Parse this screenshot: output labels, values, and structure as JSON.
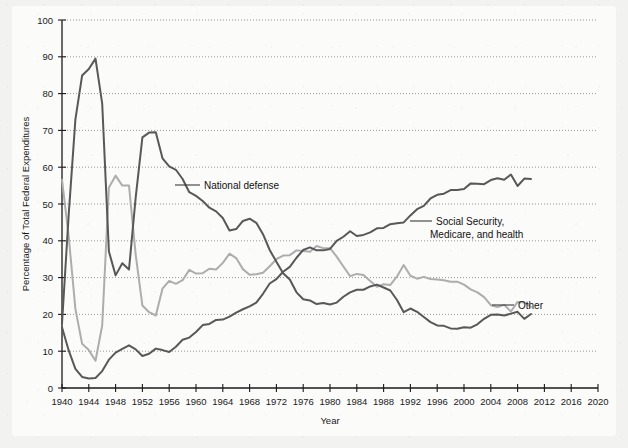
{
  "figure": {
    "background_color": "#f2f2f0",
    "card_color": "#fbfbfa"
  },
  "axes": {
    "x_title": "Year",
    "y_title": "Percentage of Total Federal Expenditures",
    "x_ticks": [
      "1940",
      "1944",
      "1948",
      "1952",
      "1956",
      "1960",
      "1964",
      "1968",
      "1972",
      "1976",
      "1980",
      "1984",
      "1988",
      "1992",
      "1996",
      "2000",
      "2004",
      "2008",
      "2012",
      "2016",
      "2020"
    ],
    "y_ticks": [
      "0",
      "10",
      "20",
      "30",
      "40",
      "50",
      "60",
      "70",
      "80",
      "90",
      "100"
    ]
  },
  "annotations": {
    "national_defense": "National defense",
    "social_security_line1": "Social Security,",
    "social_security_line2": "Medicare, and health",
    "other": "Other"
  },
  "chart_data": {
    "type": "line",
    "title": "",
    "xlabel": "Year",
    "ylabel": "Percentage of Total Federal Expenditures",
    "xlim": [
      1940,
      2020
    ],
    "ylim": [
      0,
      100
    ],
    "x_tick_step": 4,
    "y_tick_step": 10,
    "grid": "horizontal-dotted",
    "legend_position": "inline-annotations",
    "colors": {
      "national_defense": "#585858",
      "social_security": "#585858",
      "other": "#adadad"
    },
    "x": [
      1940,
      1941,
      1942,
      1943,
      1944,
      1945,
      1946,
      1947,
      1948,
      1949,
      1950,
      1951,
      1952,
      1953,
      1954,
      1955,
      1956,
      1957,
      1958,
      1959,
      1960,
      1961,
      1962,
      1963,
      1964,
      1965,
      1966,
      1967,
      1968,
      1969,
      1970,
      1971,
      1972,
      1973,
      1974,
      1975,
      1976,
      1977,
      1978,
      1979,
      1980,
      1981,
      1982,
      1983,
      1984,
      1985,
      1986,
      1987,
      1988,
      1989,
      1990,
      1991,
      1992,
      1993,
      1994,
      1995,
      1996,
      1997,
      1998,
      1999,
      2000,
      2001,
      2002,
      2003,
      2004,
      2005,
      2006,
      2007,
      2008,
      2009,
      2010
    ],
    "series": [
      {
        "name": "National defense",
        "values": [
          17.5,
          47.1,
          73.0,
          84.9,
          86.7,
          89.5,
          77.3,
          37.1,
          30.6,
          33.9,
          32.2,
          51.8,
          68.1,
          69.4,
          69.5,
          62.4,
          60.2,
          59.3,
          56.8,
          53.2,
          52.2,
          50.8,
          49.0,
          48.0,
          46.2,
          42.8,
          43.2,
          45.4,
          46.0,
          44.9,
          41.8,
          37.5,
          34.3,
          31.2,
          29.5,
          26.0,
          24.1,
          23.8,
          22.8,
          23.1,
          22.7,
          23.2,
          24.8,
          26.0,
          26.7,
          26.7,
          27.6,
          28.1,
          27.3,
          26.5,
          23.9,
          20.6,
          21.6,
          20.7,
          19.3,
          17.9,
          17.0,
          16.9,
          16.2,
          16.1,
          16.5,
          16.4,
          17.3,
          18.8,
          19.9,
          20.0,
          19.7,
          20.2,
          20.7,
          18.8,
          20.1
        ]
      },
      {
        "name": "Social Security, Medicare, and health",
        "values": [
          16.5,
          10.2,
          5.2,
          3.0,
          2.6,
          2.7,
          4.6,
          7.7,
          9.6,
          10.6,
          11.6,
          10.5,
          8.7,
          9.3,
          10.7,
          10.3,
          9.8,
          11.2,
          13.1,
          13.7,
          15.2,
          17.1,
          17.4,
          18.5,
          18.6,
          19.4,
          20.5,
          21.4,
          22.2,
          23.2,
          25.6,
          28.4,
          29.6,
          31.6,
          32.9,
          35.4,
          37.5,
          38.2,
          37.4,
          37.4,
          37.8,
          40.0,
          41.1,
          42.6,
          41.3,
          41.6,
          42.3,
          43.4,
          43.5,
          44.5,
          44.8,
          45.0,
          46.9,
          48.6,
          49.5,
          51.5,
          52.5,
          52.8,
          53.8,
          53.8,
          54.1,
          55.6,
          55.5,
          55.4,
          56.5,
          57.0,
          56.6,
          58.0,
          54.9,
          56.9,
          56.8
        ]
      },
      {
        "name": "Other",
        "values": [
          56.6,
          41.2,
          21.5,
          12.0,
          10.3,
          7.4,
          17.0,
          54.5,
          57.7,
          55.0,
          55.0,
          36.2,
          22.4,
          20.6,
          19.7,
          27.0,
          29.1,
          28.3,
          29.3,
          32.1,
          31.1,
          31.2,
          32.4,
          32.2,
          34.0,
          36.5,
          35.3,
          32.3,
          30.8,
          30.9,
          31.3,
          33.1,
          35.0,
          36.0,
          36.1,
          37.4,
          37.2,
          37.0,
          38.6,
          38.0,
          38.0,
          35.7,
          33.0,
          30.4,
          31.0,
          30.7,
          29.1,
          27.5,
          28.2,
          28.0,
          30.3,
          33.4,
          30.5,
          29.7,
          30.2,
          29.6,
          29.5,
          29.3,
          28.9,
          28.9,
          28.1,
          26.8,
          26.0,
          24.7,
          22.5,
          22.0,
          22.6,
          20.8,
          23.4,
          23.3,
          22.0
        ]
      }
    ]
  }
}
